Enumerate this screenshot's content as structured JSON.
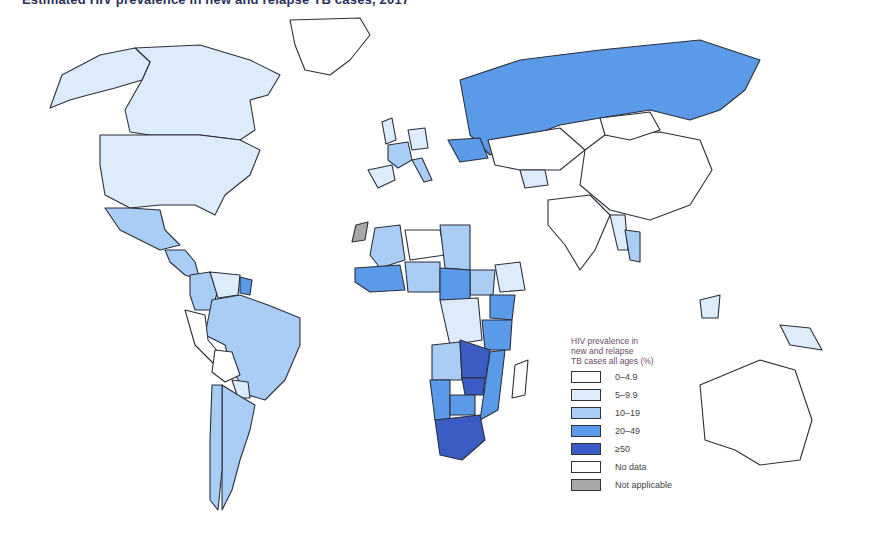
{
  "title": "Estimated HIV prevalence in new and relapse TB cases, 2017",
  "legend": {
    "title_lines": [
      "HIV prevalence in",
      "new and relapse",
      "TB cases all ages (%)"
    ],
    "items": [
      {
        "label": "0–4.9",
        "color": "#ffffff"
      },
      {
        "label": "5–9.9",
        "color": "#dcecfb"
      },
      {
        "label": "10–19",
        "color": "#a9cdf5"
      },
      {
        "label": "20–49",
        "color": "#5a9ae8"
      },
      {
        "label": "≥50",
        "color": "#3a5cc4"
      },
      {
        "label": "No data",
        "color": "#ffffff"
      },
      {
        "label": "Not applicable",
        "color": "#a8a8a8"
      }
    ]
  },
  "chart_data": {
    "type": "choropleth",
    "title": "Estimated HIV prevalence in new and relapse TB cases, 2017",
    "legend_title": "HIV prevalence in new and relapse TB cases all ages (%)",
    "legend_position": "bottom-right",
    "categories": [
      "0–4.9",
      "5–9.9",
      "10–19",
      "20–49",
      "≥50",
      "No data",
      "Not applicable"
    ],
    "regions": [
      {
        "name": "Canada",
        "category": "5–9.9"
      },
      {
        "name": "United States",
        "category": "5–9.9"
      },
      {
        "name": "Alaska",
        "category": "5–9.9"
      },
      {
        "name": "Greenland",
        "category": "0–4.9"
      },
      {
        "name": "Mexico",
        "category": "10–19"
      },
      {
        "name": "Central America",
        "category": "10–19"
      },
      {
        "name": "Colombia",
        "category": "10–19"
      },
      {
        "name": "Venezuela",
        "category": "5–9.9"
      },
      {
        "name": "Guyana",
        "category": "20–49"
      },
      {
        "name": "Brazil",
        "category": "10–19"
      },
      {
        "name": "Peru",
        "category": "0–4.9"
      },
      {
        "name": "Bolivia",
        "category": "0–4.9"
      },
      {
        "name": "Paraguay",
        "category": "5–9.9"
      },
      {
        "name": "Argentina",
        "category": "10–19"
      },
      {
        "name": "Chile",
        "category": "10–19"
      },
      {
        "name": "Russian Federation",
        "category": "20–49"
      },
      {
        "name": "Ukraine",
        "category": "20–49"
      },
      {
        "name": "France",
        "category": "10–19"
      },
      {
        "name": "Spain",
        "category": "5–9.9"
      },
      {
        "name": "Italy",
        "category": "10–19"
      },
      {
        "name": "Germany",
        "category": "5–9.9"
      },
      {
        "name": "United Kingdom",
        "category": "5–9.9"
      },
      {
        "name": "Kazakhstan",
        "category": "0–4.9"
      },
      {
        "name": "Uzbekistan",
        "category": "5–9.9"
      },
      {
        "name": "China",
        "category": "0–4.9"
      },
      {
        "name": "Mongolia",
        "category": "0–4.9"
      },
      {
        "name": "India",
        "category": "0–4.9"
      },
      {
        "name": "Myanmar",
        "category": "5–9.9"
      },
      {
        "name": "Thailand",
        "category": "10–19"
      },
      {
        "name": "Papua New Guinea",
        "category": "5–9.9"
      },
      {
        "name": "Malaysia (Borneo)",
        "category": "5–9.9"
      },
      {
        "name": "Australia",
        "category": "0–4.9"
      },
      {
        "name": "Western Sahara",
        "category": "Not applicable"
      },
      {
        "name": "Mali",
        "category": "10–19"
      },
      {
        "name": "West Africa coast",
        "category": "20–49"
      },
      {
        "name": "Niger",
        "category": "0–4.9"
      },
      {
        "name": "Chad",
        "category": "10–19"
      },
      {
        "name": "Nigeria",
        "category": "10–19"
      },
      {
        "name": "Ethiopia",
        "category": "5–9.9"
      },
      {
        "name": "South Sudan",
        "category": "10–19"
      },
      {
        "name": "Cameroon/CAR",
        "category": "20–49"
      },
      {
        "name": "Democratic Republic of the Congo",
        "category": "5–9.9"
      },
      {
        "name": "Kenya",
        "category": "20–49"
      },
      {
        "name": "Tanzania",
        "category": "20–49"
      },
      {
        "name": "Angola",
        "category": "10–19"
      },
      {
        "name": "Zambia",
        "category": "≥50"
      },
      {
        "name": "Zimbabwe",
        "category": "≥50"
      },
      {
        "name": "Mozambique",
        "category": "20–49"
      },
      {
        "name": "Namibia",
        "category": "20–49"
      },
      {
        "name": "Botswana",
        "category": "20–49"
      },
      {
        "name": "South Africa",
        "category": "≥50"
      },
      {
        "name": "Madagascar",
        "category": "0–4.9"
      }
    ]
  }
}
